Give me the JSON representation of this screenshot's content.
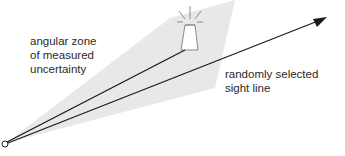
{
  "diagram": {
    "labels": {
      "zone_line1": "angular zone",
      "zone_line2": "of measured",
      "zone_line3": "uncertainty",
      "sight_line1": "randomly selected",
      "sight_line2": "sight line"
    },
    "elements": {
      "observer": "observer-point-circle",
      "landmark": "lighthouse-icon",
      "measured_bearing": "line to lighthouse",
      "random_sight_line": "arrow line"
    },
    "colors": {
      "wedge_fill": "#e6e6e6",
      "line": "#1a1a1a",
      "lighthouse_stroke": "#8a8a8a",
      "text": "#2a2a2a"
    }
  }
}
